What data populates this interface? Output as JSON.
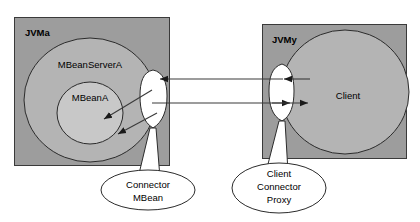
{
  "diagram": {
    "colors": {
      "jvm_box_fill": "#9d9d9d",
      "jvm_box_stroke": "#3a3a3a",
      "mbeanserver_fill": "#b4b4b4",
      "mbean_fill": "#c8c8c8",
      "client_fill": "#b4b4b4",
      "connector_fill": "#ffffff",
      "callout_fill": "#ffffff",
      "stroke": "#2b2b2b",
      "arrow": "#1a1a1a",
      "text": "#000000",
      "page_background": "#ffffff"
    },
    "left_jvm": {
      "label": "JVMa",
      "server_label": "MBeanServerA",
      "mbean_label": "MBeanA",
      "connector_callout": {
        "line1": "Connector",
        "line2": "MBean"
      }
    },
    "right_jvm": {
      "label": "JVMy",
      "client_label": "Client",
      "proxy_callout": {
        "line1": "Client",
        "line2": "Connector",
        "line3": "Proxy"
      }
    },
    "connections": [
      {
        "name": "response-channel",
        "from": "client-connector-proxy",
        "to": "connector-mbean",
        "direction": "right-to-left"
      },
      {
        "name": "request-channel",
        "from": "connector-mbean",
        "to": "client-connector-proxy",
        "direction": "left-to-right"
      },
      {
        "name": "connector-to-mbean-upper",
        "from": "connector-mbean",
        "to": "mbean-a",
        "direction": "right-to-left"
      },
      {
        "name": "connector-to-mbean-lower",
        "from": "connector-mbean",
        "to": "mbean-a",
        "direction": "right-to-left"
      },
      {
        "name": "proxy-to-client",
        "from": "client",
        "to": "client-connector-proxy",
        "direction": "right-to-left"
      },
      {
        "name": "client-to-proxy",
        "from": "client-connector-proxy",
        "to": "client",
        "direction": "left-to-right"
      }
    ]
  }
}
